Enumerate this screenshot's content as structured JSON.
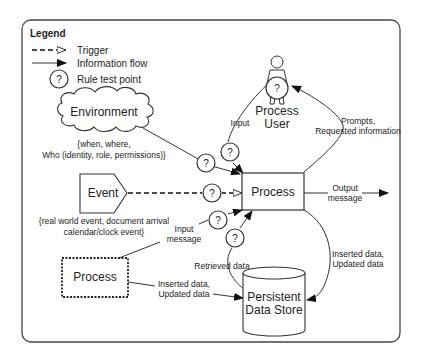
{
  "legend": {
    "title": "Legend",
    "items": [
      {
        "label": "Trigger",
        "icon": "dashed-open-arrow"
      },
      {
        "label": "Information flow",
        "icon": "solid-filled-arrow"
      },
      {
        "label": "Rule test point",
        "icon": "question-circle"
      }
    ]
  },
  "nodes": {
    "environment": {
      "label": "Environment",
      "note_line1": "{when, where,",
      "note_line2": "Who (identity, role, permissions)}"
    },
    "event": {
      "label": "Event",
      "note_line1": "{real world event, document arrival",
      "note_line2": "calendar/clock event}"
    },
    "process_main": {
      "label": "Process"
    },
    "process_external": {
      "label": "Process"
    },
    "user": {
      "label_line1": "Process",
      "label_line2": "User"
    },
    "datastore": {
      "label_line1": "Persistent",
      "label_line2": "Data Store"
    }
  },
  "edges": {
    "input": "Input",
    "prompts_line1": "Prompts,",
    "prompts_line2": "Requested information",
    "output_line1": "Output",
    "output_line2": "message",
    "input_message_line1": "Input",
    "input_message_line2": "message",
    "retrieved": "Retrieved data",
    "inserted_right_line1": "Inserted data,",
    "inserted_right_line2": "Updated data",
    "inserted_left_line1": "Inserted data,",
    "inserted_left_line2": "Updated data"
  },
  "test_point_symbol": "?"
}
